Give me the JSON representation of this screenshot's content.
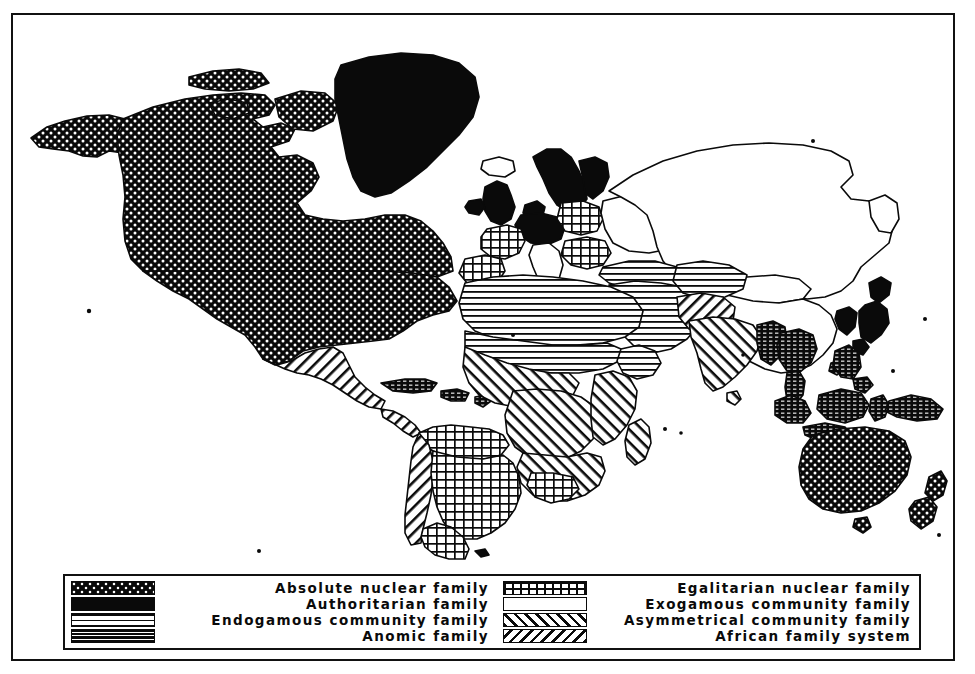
{
  "figure": {
    "type": "thematic-world-map",
    "frame_color": "#111111",
    "background_color": "#ffffff",
    "ink_color": "#0a0a0a"
  },
  "legend": {
    "columns": [
      {
        "side": "left",
        "entries": [
          {
            "key": "absolute_nuclear",
            "label": "Absolute nuclear family",
            "pattern": "dense-diamond-crosshatch-on-black",
            "swatch_class": "sw-absolute"
          },
          {
            "key": "authoritarian",
            "label": "Authoritarian family",
            "pattern": "solid-black",
            "swatch_class": "sw-authoritarian"
          },
          {
            "key": "endogamous_community",
            "label": "Endogamous community family",
            "pattern": "horizontal-lines-on-white",
            "swatch_class": "sw-endogamous"
          },
          {
            "key": "anomic",
            "label": "Anomic family",
            "pattern": "broken-horizontal-lines-on-black",
            "swatch_class": "sw-anomic"
          }
        ]
      },
      {
        "side": "right",
        "entries": [
          {
            "key": "egalitarian_nuclear",
            "label": "Egalitarian nuclear family",
            "pattern": "square-grid-on-white",
            "swatch_class": "sw-egalitarian"
          },
          {
            "key": "exogamous_community",
            "label": "Exogamous community family",
            "pattern": "plain-white",
            "swatch_class": "sw-exogamous"
          },
          {
            "key": "asymmetrical_community",
            "label": "Asymmetrical community family",
            "pattern": "forward-diagonal-hatch",
            "swatch_class": "sw-asymmetrical"
          },
          {
            "key": "african_family",
            "label": "African family system",
            "pattern": "backward-diagonal-hatch",
            "swatch_class": "sw-african"
          }
        ]
      }
    ]
  },
  "map_regions": [
    {
      "name": "Alaska",
      "category": "absolute_nuclear"
    },
    {
      "name": "Canada",
      "category": "absolute_nuclear"
    },
    {
      "name": "United States",
      "category": "absolute_nuclear"
    },
    {
      "name": "Greenland",
      "category": "authoritarian"
    },
    {
      "name": "Iceland",
      "category": "exogamous_community"
    },
    {
      "name": "Mexico",
      "category": "asymmetrical_community"
    },
    {
      "name": "Central America",
      "category": "asymmetrical_community"
    },
    {
      "name": "Caribbean",
      "category": "anomic"
    },
    {
      "name": "Andean region",
      "category": "asymmetrical_community"
    },
    {
      "name": "Brazil",
      "category": "egalitarian_nuclear"
    },
    {
      "name": "Argentina",
      "category": "egalitarian_nuclear"
    },
    {
      "name": "Chile",
      "category": "egalitarian_nuclear"
    },
    {
      "name": "British Isles",
      "category": "authoritarian"
    },
    {
      "name": "Scandinavia",
      "category": "authoritarian"
    },
    {
      "name": "Germany",
      "category": "authoritarian"
    },
    {
      "name": "France",
      "category": "egalitarian_nuclear"
    },
    {
      "name": "Iberia",
      "category": "egalitarian_nuclear"
    },
    {
      "name": "Poland",
      "category": "egalitarian_nuclear"
    },
    {
      "name": "Balkans",
      "category": "egalitarian_nuclear"
    },
    {
      "name": "Italy",
      "category": "exogamous_community"
    },
    {
      "name": "Russia",
      "category": "exogamous_community"
    },
    {
      "name": "China",
      "category": "exogamous_community"
    },
    {
      "name": "Mongolia",
      "category": "exogamous_community"
    },
    {
      "name": "Japan",
      "category": "authoritarian"
    },
    {
      "name": "Korea",
      "category": "authoritarian"
    },
    {
      "name": "North Africa",
      "category": "endogamous_community"
    },
    {
      "name": "Middle East",
      "category": "endogamous_community"
    },
    {
      "name": "Central Asia",
      "category": "endogamous_community"
    },
    {
      "name": "Sahel",
      "category": "endogamous_community"
    },
    {
      "name": "Sub-Saharan Africa",
      "category": "african_family"
    },
    {
      "name": "Madagascar",
      "category": "african_family"
    },
    {
      "name": "India",
      "category": "african_family"
    },
    {
      "name": "Pakistan",
      "category": "asymmetrical_community"
    },
    {
      "name": "Myanmar",
      "category": "anomic"
    },
    {
      "name": "Thailand",
      "category": "anomic"
    },
    {
      "name": "Indochina",
      "category": "anomic"
    },
    {
      "name": "Indonesia",
      "category": "anomic"
    },
    {
      "name": "Philippines",
      "category": "anomic"
    },
    {
      "name": "New Guinea",
      "category": "anomic"
    },
    {
      "name": "Australia",
      "category": "absolute_nuclear"
    },
    {
      "name": "New Zealand",
      "category": "absolute_nuclear"
    }
  ]
}
